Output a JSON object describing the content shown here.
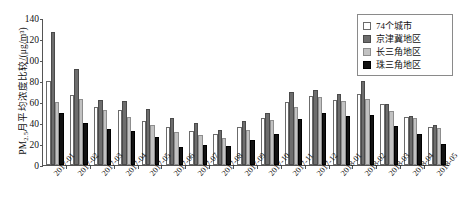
{
  "chart_data": {
    "type": "bar",
    "title": "",
    "xlabel": "",
    "ylabel": "PM2.5月平均浓度比较/(μg/m³)",
    "ylim": [
      0,
      140
    ],
    "yticks": [
      0,
      20,
      40,
      60,
      80,
      100,
      120,
      140
    ],
    "grid": false,
    "legend_position": "top-right",
    "categories": [
      "2017-01",
      "2017-02",
      "2017-03",
      "2017-04",
      "2017-05",
      "2017-06",
      "2017-07",
      "2017-08",
      "2017-09",
      "2017-10",
      "2017-11",
      "2017-12",
      "2018-01",
      "2018-02",
      "2018-03",
      "2018-04",
      "2018-05"
    ],
    "series": [
      {
        "name": "74个城市",
        "color": "#ffffff",
        "values": [
          80,
          67,
          55,
          52,
          42,
          36,
          32,
          30,
          36,
          45,
          60,
          66,
          62,
          68,
          58,
          46,
          36
        ]
      },
      {
        "name": "京津冀地区",
        "color": "#6d6d6d",
        "values": [
          127,
          91,
          62,
          61,
          53,
          45,
          40,
          33,
          42,
          50,
          70,
          71,
          68,
          80,
          58,
          47,
          38
        ]
      },
      {
        "name": "长三角地区",
        "color": "#c2c2c2",
        "values": [
          60,
          63,
          52,
          46,
          38,
          31,
          29,
          26,
          33,
          43,
          55,
          65,
          61,
          63,
          51,
          45,
          35
        ]
      },
      {
        "name": "珠三角地区",
        "color": "#121212",
        "values": [
          50,
          40,
          34,
          32,
          27,
          17,
          19,
          18,
          24,
          30,
          44,
          50,
          47,
          48,
          37,
          30,
          20
        ]
      }
    ]
  },
  "legend": {
    "items": [
      {
        "label": "74个城市"
      },
      {
        "label": "京津冀地区"
      },
      {
        "label": "长三角地区"
      },
      {
        "label": "珠三角地区"
      }
    ]
  },
  "ylabel_parts": {
    "prefix": "PM",
    "sub": "2.5",
    "suffix": "月平均浓度比较/(μg/m³)"
  },
  "caption": ""
}
